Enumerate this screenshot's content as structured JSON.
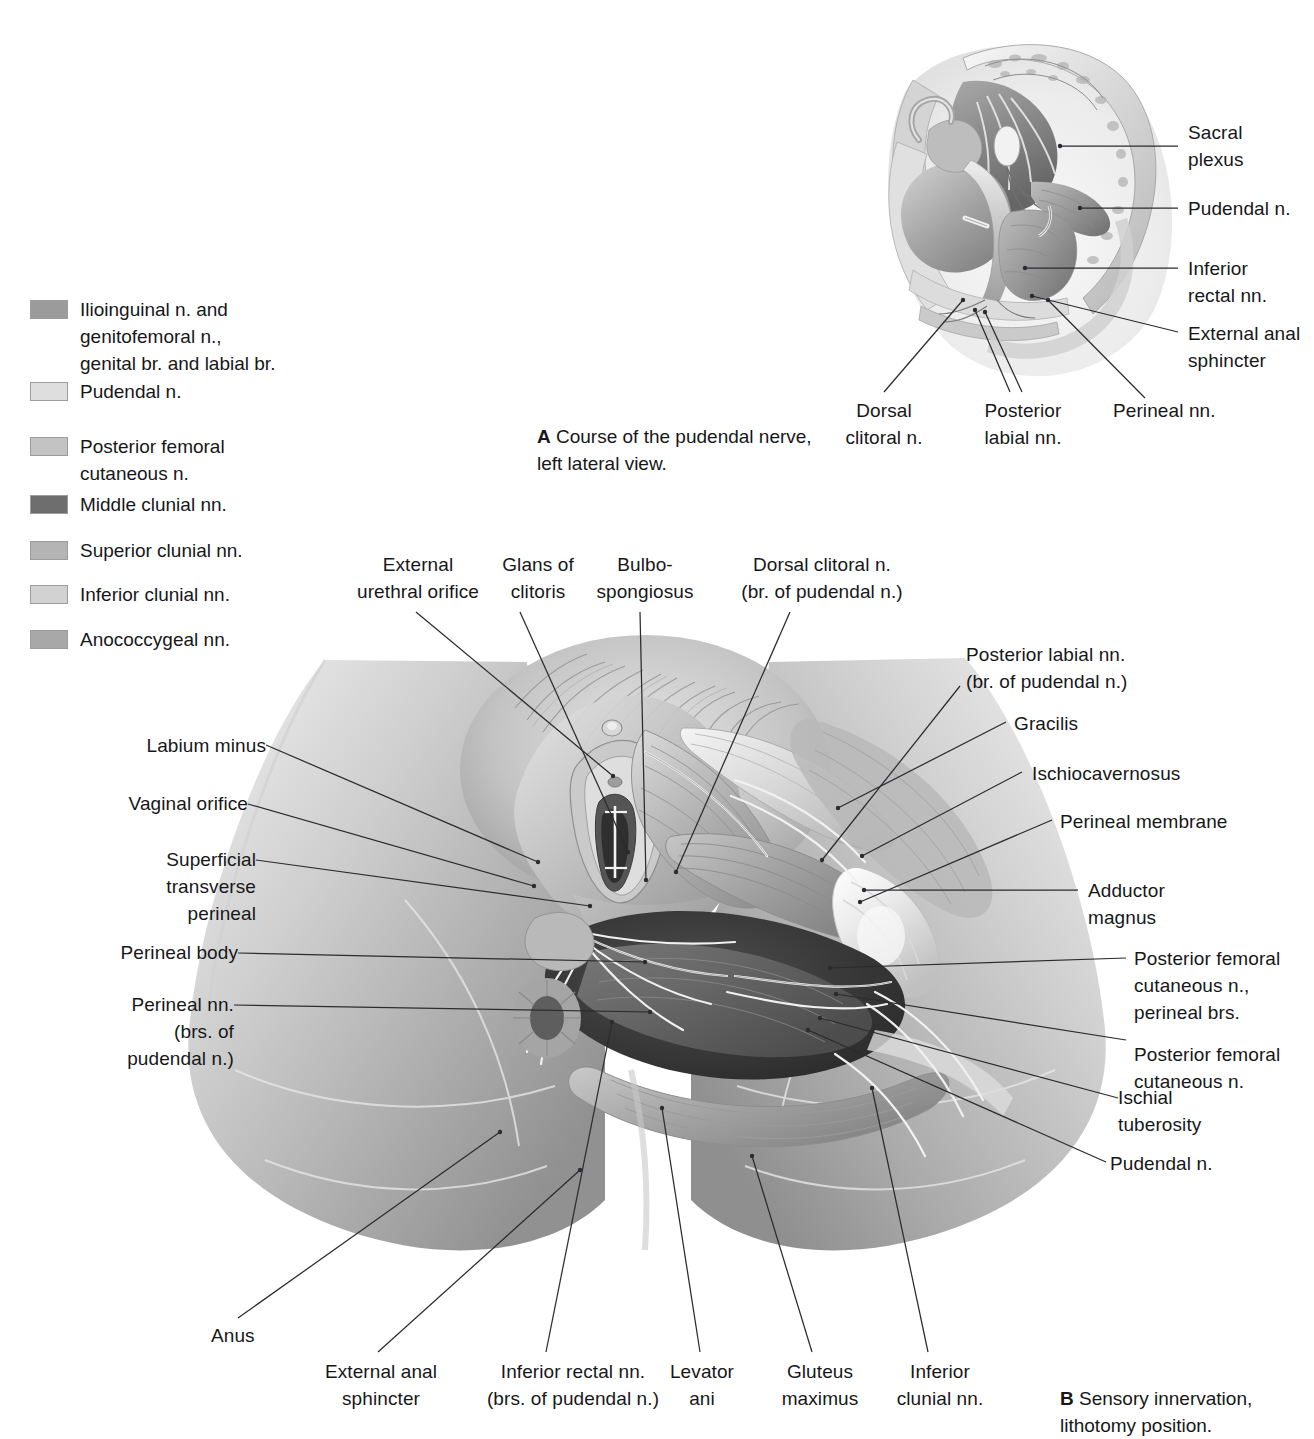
{
  "legend": {
    "items": [
      {
        "label": "Ilioinguinal n. and\ngenitofemoral n.,\ngenital br. and labial br.",
        "color": "#9b9b9b"
      },
      {
        "label": "Pudendal n.",
        "color": "#dedede"
      },
      {
        "label": "Posterior femoral\ncutaneous n.",
        "color": "#c3c3c3"
      },
      {
        "label": "Middle clunial nn.",
        "color": "#6e6e6e"
      },
      {
        "label": "Superior clunial nn.",
        "color": "#b4b4b4"
      },
      {
        "label": "Inferior clunial nn.",
        "color": "#d2d2d2"
      },
      {
        "label": "Anococcygeal nn.",
        "color": "#a8a8a8"
      }
    ]
  },
  "figureA": {
    "caption_letter": "A",
    "caption_text": "Course of the pudendal nerve,\nleft lateral view.",
    "labels": {
      "sacral_plexus": "Sacral\nplexus",
      "pudendal_n": "Pudendal n.",
      "inferior_rectal_nn": "Inferior\nrectal nn.",
      "external_anal_sphincter": "External anal\nsphincter",
      "dorsal_clitoral_n": "Dorsal\nclitoral n.",
      "posterior_labial_nn": "Posterior\nlabial nn.",
      "perineal_nn": "Perineal nn."
    }
  },
  "figureB": {
    "caption_letter": "B",
    "caption_text": "Sensory innervation,\nlithotomy position.",
    "labels": {
      "external_urethral_orifice": "External\nurethral orifice",
      "glans_of_clitoris": "Glans of\nclitoris",
      "bulbospongiosus": "Bulbo-\nspongiosus",
      "dorsal_clitoral_n": "Dorsal clitoral n.\n(br. of pudendal n.)",
      "posterior_labial_nn": "Posterior labial nn.\n(br. of pudendal n.)",
      "gracilis": "Gracilis",
      "ischiocavernosus": "Ischiocavernosus",
      "perineal_membrane": "Perineal membrane",
      "adductor_magnus": "Adductor\nmagnus",
      "pfc_perineal_brs": "Posterior femoral\ncutaneous n.,\nperineal brs.",
      "pfc_n": "Posterior femoral\ncutaneous n.",
      "ischial_tuberosity": "Ischial\ntuberosity",
      "pudendal_n": "Pudendal n.",
      "labium_minus": "Labium minus",
      "vaginal_orifice": "Vaginal orifice",
      "superficial_transverse_perineal": "Superficial\ntransverse\nperineal",
      "perineal_body": "Perineal body",
      "perineal_nn": "Perineal nn.\n(brs. of\npudendal n.)",
      "anus": "Anus",
      "external_anal_sphincter": "External anal\nsphincter",
      "inferior_rectal_nn": "Inferior rectal nn.\n(brs. of pudendal n.)",
      "levator_ani": "Levator\nani",
      "gluteus_maximus": "Gluteus\nmaximus",
      "inferior_clunial_nn": "Inferior\nclunial nn."
    }
  }
}
